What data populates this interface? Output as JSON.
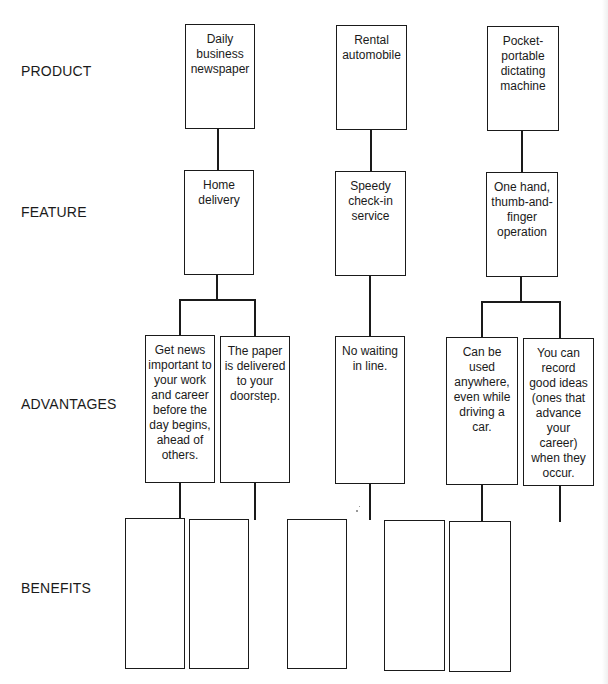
{
  "row_labels": {
    "product": "PRODUCT",
    "feature": "FEATURE",
    "advantages": "ADVANTAGES",
    "benefits": "BENEFITS"
  },
  "columns": [
    {
      "product": "Daily\nbusiness\nnewspaper",
      "feature": "Home\ndelivery",
      "advantages": [
        "Get news\nimportant to\nyour work\nand career\nbefore the\nday begins,\nahead of\nothers.",
        "The paper\nis delivered\nto your\ndoorstep."
      ],
      "benefits": [
        "",
        ""
      ]
    },
    {
      "product": "Rental\nautomobile",
      "feature": "Speedy\ncheck-in\nservice",
      "advantages": [
        "No waiting\nin line."
      ],
      "benefits": [
        ""
      ]
    },
    {
      "product": "Pocket-\nportable\ndictating\nmachine",
      "feature": "One hand,\nthumb-and-\nfinger\noperation",
      "advantages": [
        "Can be\nused\nanywhere,\neven while\ndriving a\ncar.",
        "You can\nrecord\ngood ideas\n(ones that\nadvance\nyour\ncareer)\nwhen they\noccur."
      ],
      "benefits": [
        "",
        ""
      ]
    }
  ]
}
